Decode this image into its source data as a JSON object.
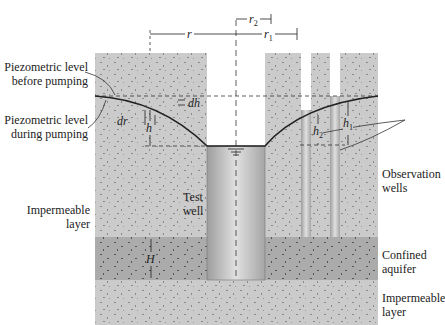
{
  "labels": {
    "piezo_before": [
      "Piezometric level",
      "before pumping"
    ],
    "piezo_during": [
      "Piezometric level",
      "during pumping"
    ],
    "impermeable_upper": [
      "Impermeable",
      "layer"
    ],
    "test_well": [
      "Test",
      "well"
    ],
    "observation_wells": [
      "Observation",
      "wells"
    ],
    "confined_aquifer": [
      "Confined",
      "aquifer"
    ],
    "impermeable_lower": [
      "Impermeable",
      "layer"
    ]
  },
  "symbols": {
    "r": "r",
    "r1": "r",
    "r1_sub": "1",
    "r2": "r",
    "r2_sub": "2",
    "dh": "dh",
    "dr": "dr",
    "h": "h",
    "h1": "h",
    "h1_sub": "1",
    "h2": "h",
    "h2_sub": "2",
    "H": "H"
  },
  "colors": {
    "soil": "#c9c9c9",
    "aquifer": "#a9a9a9",
    "well": "#bdbdbd",
    "line": "#222222"
  }
}
